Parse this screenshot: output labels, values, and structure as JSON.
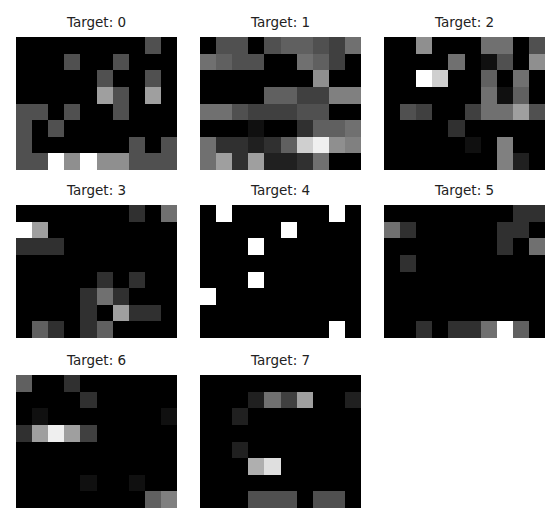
{
  "chart_data": {
    "type": "heatmap",
    "title": "",
    "colormap": "gray",
    "value_range": [
      0,
      16
    ],
    "grid_shape": {
      "rows": 8,
      "cols": 10
    },
    "axes": "off",
    "panels": [
      {
        "title": "Target: 0",
        "values": [
          [
            0,
            0,
            0,
            0,
            0,
            0,
            0,
            0,
            5,
            0
          ],
          [
            0,
            0,
            0,
            5,
            0,
            0,
            5,
            0,
            0,
            0
          ],
          [
            0,
            0,
            0,
            0,
            0,
            5,
            0,
            0,
            5,
            0
          ],
          [
            0,
            0,
            0,
            0,
            0,
            10,
            5,
            0,
            10,
            0
          ],
          [
            5,
            5,
            0,
            5,
            0,
            0,
            5,
            0,
            0,
            0
          ],
          [
            5,
            0,
            5,
            0,
            0,
            0,
            0,
            0,
            0,
            0
          ],
          [
            5,
            0,
            0,
            0,
            0,
            0,
            0,
            5,
            0,
            5
          ],
          [
            5,
            5,
            16,
            9,
            16,
            9,
            9,
            5,
            5,
            5
          ]
        ]
      },
      {
        "title": "Target: 1",
        "values": [
          [
            0,
            5,
            5,
            0,
            5,
            6,
            6,
            5,
            4,
            7
          ],
          [
            7,
            6,
            5,
            5,
            0,
            0,
            7,
            6,
            4,
            0
          ],
          [
            0,
            0,
            0,
            0,
            0,
            0,
            0,
            9,
            0,
            0
          ],
          [
            0,
            0,
            0,
            0,
            6,
            6,
            4,
            4,
            8,
            8
          ],
          [
            7,
            7,
            5,
            4,
            4,
            4,
            5,
            5,
            0,
            0
          ],
          [
            0,
            0,
            0,
            1,
            0,
            0,
            3,
            6,
            6,
            7
          ],
          [
            7,
            3,
            3,
            2,
            3,
            6,
            13,
            15,
            9,
            8
          ],
          [
            7,
            10,
            3,
            10,
            2,
            2,
            3,
            7,
            0,
            0
          ]
        ]
      },
      {
        "title": "Target: 2",
        "values": [
          [
            0,
            0,
            9,
            0,
            0,
            0,
            7,
            7,
            0,
            5
          ],
          [
            0,
            0,
            0,
            0,
            7,
            0,
            1,
            5,
            0,
            9
          ],
          [
            0,
            0,
            16,
            13,
            0,
            0,
            6,
            0,
            7,
            0
          ],
          [
            0,
            0,
            0,
            0,
            0,
            0,
            7,
            1,
            6,
            0
          ],
          [
            0,
            5,
            4,
            0,
            0,
            4,
            7,
            7,
            10,
            5
          ],
          [
            0,
            0,
            0,
            0,
            3,
            0,
            0,
            0,
            0,
            0
          ],
          [
            0,
            0,
            0,
            0,
            0,
            1,
            0,
            8,
            0,
            0
          ],
          [
            0,
            0,
            0,
            0,
            0,
            0,
            0,
            8,
            2,
            0
          ]
        ]
      },
      {
        "title": "Target: 3",
        "values": [
          [
            0,
            0,
            0,
            0,
            0,
            0,
            0,
            3,
            0,
            7
          ],
          [
            16,
            10,
            0,
            0,
            0,
            0,
            0,
            0,
            0,
            0
          ],
          [
            3,
            3,
            3,
            0,
            0,
            0,
            0,
            0,
            0,
            0
          ],
          [
            0,
            0,
            0,
            0,
            0,
            0,
            0,
            0,
            0,
            0
          ],
          [
            0,
            0,
            0,
            0,
            0,
            3,
            0,
            3,
            0,
            0
          ],
          [
            0,
            0,
            0,
            0,
            3,
            7,
            3,
            0,
            0,
            0
          ],
          [
            0,
            0,
            0,
            0,
            3,
            0,
            10,
            3,
            3,
            0
          ],
          [
            0,
            6,
            3,
            0,
            3,
            6,
            0,
            0,
            0,
            0
          ]
        ]
      },
      {
        "title": "Target: 4",
        "values": [
          [
            0,
            16,
            0,
            0,
            0,
            0,
            0,
            0,
            16,
            0
          ],
          [
            0,
            0,
            0,
            0,
            0,
            16,
            0,
            0,
            0,
            0
          ],
          [
            0,
            0,
            0,
            16,
            0,
            0,
            0,
            0,
            0,
            0
          ],
          [
            0,
            0,
            0,
            0,
            0,
            0,
            0,
            0,
            0,
            0
          ],
          [
            0,
            0,
            0,
            16,
            0,
            0,
            0,
            0,
            0,
            0
          ],
          [
            16,
            0,
            0,
            0,
            0,
            0,
            0,
            0,
            0,
            0
          ],
          [
            0,
            0,
            0,
            0,
            0,
            0,
            0,
            0,
            0,
            0
          ],
          [
            0,
            0,
            0,
            0,
            0,
            0,
            0,
            0,
            16,
            0
          ]
        ]
      },
      {
        "title": "Target: 5",
        "values": [
          [
            0,
            0,
            0,
            0,
            0,
            0,
            0,
            0,
            3,
            3
          ],
          [
            7,
            3,
            0,
            0,
            0,
            0,
            0,
            3,
            3,
            0
          ],
          [
            0,
            0,
            0,
            0,
            0,
            0,
            0,
            3,
            0,
            7
          ],
          [
            0,
            3,
            0,
            0,
            0,
            0,
            0,
            0,
            0,
            0
          ],
          [
            0,
            0,
            0,
            0,
            0,
            0,
            0,
            0,
            0,
            0
          ],
          [
            0,
            0,
            0,
            0,
            0,
            0,
            0,
            0,
            0,
            0
          ],
          [
            0,
            0,
            0,
            0,
            0,
            0,
            0,
            0,
            0,
            0
          ],
          [
            0,
            0,
            3,
            0,
            3,
            3,
            7,
            16,
            6,
            0
          ]
        ]
      },
      {
        "title": "Target: 6",
        "values": [
          [
            6,
            0,
            0,
            3,
            0,
            0,
            0,
            0,
            0,
            0
          ],
          [
            0,
            0,
            0,
            0,
            3,
            0,
            0,
            0,
            0,
            0
          ],
          [
            0,
            1,
            0,
            0,
            0,
            0,
            0,
            0,
            0,
            1
          ],
          [
            3,
            10,
            15,
            10,
            4,
            0,
            0,
            0,
            0,
            0
          ],
          [
            0,
            0,
            0,
            0,
            0,
            0,
            0,
            0,
            0,
            0
          ],
          [
            0,
            0,
            0,
            0,
            0,
            0,
            0,
            0,
            0,
            0
          ],
          [
            0,
            0,
            0,
            0,
            1,
            0,
            0,
            1,
            0,
            0
          ],
          [
            0,
            0,
            0,
            0,
            0,
            0,
            0,
            0,
            6,
            8
          ]
        ]
      },
      {
        "title": "Target: 7",
        "values": [
          [
            0,
            0,
            0,
            0,
            0,
            0,
            0,
            0,
            0,
            0
          ],
          [
            0,
            0,
            0,
            2,
            7,
            4,
            10,
            0,
            0,
            2
          ],
          [
            0,
            0,
            2,
            0,
            0,
            0,
            0,
            0,
            0,
            0
          ],
          [
            0,
            0,
            0,
            0,
            0,
            0,
            0,
            0,
            0,
            0
          ],
          [
            0,
            0,
            2,
            0,
            0,
            0,
            0,
            0,
            0,
            0
          ],
          [
            0,
            0,
            0,
            11,
            14,
            0,
            0,
            0,
            0,
            0
          ],
          [
            0,
            0,
            0,
            0,
            0,
            0,
            0,
            0,
            0,
            0
          ],
          [
            0,
            0,
            0,
            5,
            5,
            5,
            0,
            5,
            5,
            0
          ]
        ]
      }
    ]
  }
}
